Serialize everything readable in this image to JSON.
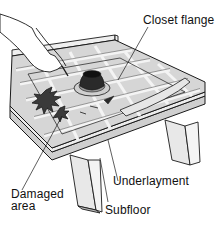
{
  "diagram": {
    "labels": {
      "closet_flange": "Closet flange",
      "underlayment": "Underlayment",
      "damaged_area_line1": "Damaged",
      "damaged_area_line2": "area",
      "subfloor": "Subfloor"
    },
    "colors": {
      "background": "#ffffff",
      "line": "#1a1a1a",
      "tile_fill": "#d6d6d6",
      "grout": "#f2f2f2",
      "flange_dark": "#2a2a2a",
      "board_fill": "#e4e4e4"
    }
  }
}
